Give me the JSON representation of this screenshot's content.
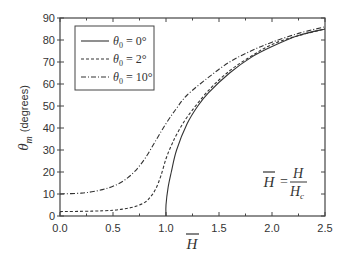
{
  "chart_data": {
    "type": "line",
    "title": "",
    "xlabel": "H̄",
    "ylabel": "θm (degrees)",
    "xlim": [
      0.0,
      2.5
    ],
    "ylim": [
      0,
      90
    ],
    "xticks": [
      "0.0",
      "0.5",
      "1.0",
      "1.5",
      "2.0",
      "2.5"
    ],
    "yticks": [
      "0",
      "10",
      "20",
      "30",
      "40",
      "50",
      "60",
      "70",
      "80",
      "90"
    ],
    "legend_position": "upper left",
    "annotation": "H̄ = H / Hc",
    "series": [
      {
        "name": "θ0 = 0°",
        "style": "solid",
        "x": [
          1.0,
          1.0,
          1.02,
          1.05,
          1.1,
          1.2,
          1.3,
          1.4,
          1.6,
          1.8,
          2.0,
          2.25,
          2.5
        ],
        "y": [
          0,
          5,
          13,
          20,
          30,
          42,
          50,
          56,
          65,
          72,
          77,
          82,
          85
        ]
      },
      {
        "name": "θ0 = 2°",
        "style": "dashed",
        "x": [
          0.0,
          0.3,
          0.5,
          0.6,
          0.7,
          0.8,
          0.85,
          0.9,
          0.95,
          1.0,
          1.05,
          1.1,
          1.2,
          1.4,
          1.6,
          1.8,
          2.0,
          2.25,
          2.5
        ],
        "y": [
          2,
          2.2,
          2.6,
          3.2,
          4.2,
          6.2,
          8.5,
          12,
          18,
          26,
          32,
          37,
          45,
          57,
          66,
          72.5,
          78,
          82,
          85
        ]
      },
      {
        "name": "θ0 = 10°",
        "style": "dash-dot",
        "x": [
          0.0,
          0.2,
          0.3,
          0.4,
          0.5,
          0.6,
          0.7,
          0.8,
          0.9,
          1.0,
          1.1,
          1.2,
          1.4,
          1.6,
          1.8,
          2.0,
          2.25,
          2.5
        ],
        "y": [
          10,
          10.4,
          11,
          12,
          13.5,
          16,
          20,
          26,
          34,
          42,
          49,
          55,
          63,
          70,
          75,
          79,
          83,
          86
        ]
      }
    ]
  },
  "legend": {
    "items": [
      {
        "label": "θ",
        "sub": "0",
        "value": " = 0°"
      },
      {
        "label": "θ",
        "sub": "0",
        "value": " = 2°"
      },
      {
        "label": "θ",
        "sub": "0",
        "value": " = 10°"
      }
    ]
  },
  "axis": {
    "y_label_main": "θ",
    "y_label_sub": "m",
    "y_label_unit": "(degrees)",
    "x_label": "H"
  },
  "annotation": {
    "lhs": "H",
    "num": "H",
    "den": "H",
    "den_sub": "c",
    "eq": "="
  }
}
